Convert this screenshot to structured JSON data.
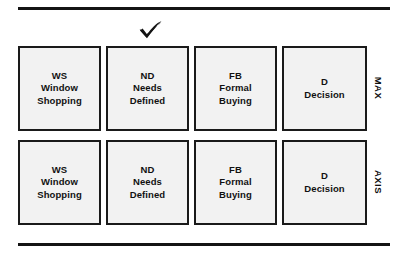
{
  "diagram": {
    "colors": {
      "rule": "#141414",
      "box_fill": "#f2f2f2",
      "box_border": "#1a1a1a",
      "text": "#111111"
    },
    "rules": {
      "top_label": "top-divider-rule",
      "bottom_label": "bottom-divider-rule"
    },
    "check": {
      "name": "check-mark-icon",
      "glyph": "✓",
      "above_stage": "ND"
    },
    "rows": [
      {
        "axis_label": "MAX",
        "cells": [
          {
            "abbr": "WS",
            "line2": "Window",
            "line3": "Shopping"
          },
          {
            "abbr": "ND",
            "line2": "Needs",
            "line3": "Defined"
          },
          {
            "abbr": "FB",
            "line2": "Formal",
            "line3": "Buying"
          },
          {
            "abbr": "D",
            "line2": "Decision",
            "line3": ""
          }
        ]
      },
      {
        "axis_label": "AXIS",
        "cells": [
          {
            "abbr": "WS",
            "line2": "Window",
            "line3": "Shopping"
          },
          {
            "abbr": "ND",
            "line2": "Needs",
            "line3": "Defined"
          },
          {
            "abbr": "FB",
            "line2": "Formal",
            "line3": "Buying"
          },
          {
            "abbr": "D",
            "line2": "Decision",
            "line3": ""
          }
        ]
      }
    ]
  }
}
